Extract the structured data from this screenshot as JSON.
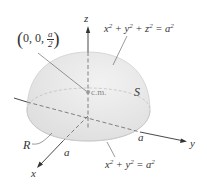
{
  "diagram": {
    "type": "hemisphere-center-of-mass",
    "axes": {
      "x": "x",
      "y": "y",
      "z": "z"
    },
    "surface_label": "S",
    "region_label": "R",
    "radius_label_x": "a",
    "radius_label_y": "a",
    "center_of_mass_label": "c.m.",
    "center_point": {
      "open": "(",
      "prefix": "0, 0, ",
      "num": "a",
      "den": "2",
      "close": ")"
    },
    "surface_equation": {
      "x": "x",
      "y": "y",
      "z": "z",
      "a": "a",
      "exp": "2",
      "plus": " + ",
      "eq": " = "
    },
    "base_equation": {
      "x": "x",
      "y": "y",
      "a": "a",
      "exp": "2",
      "plus": " + ",
      "eq": " = "
    },
    "colors": {
      "fill": "#e4e4e4",
      "stroke": "#c8c8c8",
      "axis": "#333333",
      "dash": "#666666",
      "cm_dot": "#999999"
    }
  }
}
